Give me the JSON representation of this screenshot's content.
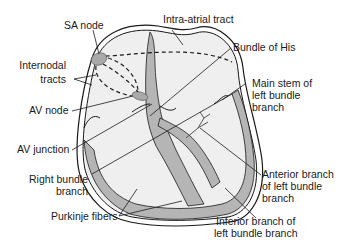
{
  "colors": {
    "background": "#ffffff",
    "chamber_fill": "#efefef",
    "tissue_fill": "#b5b5b5",
    "node_fill": "#a9a9a9",
    "outline": "#1a1a1a"
  },
  "labels": {
    "sa_node": "SA node",
    "intra_atrial_tract": "Intra-atrial tract",
    "bundle_of_his": "Bundle of His",
    "internodal_tracts_1": "Internodal",
    "internodal_tracts_2": "tracts",
    "main_stem_1": "Main stem of",
    "main_stem_2": "left bundle",
    "main_stem_3": "branch",
    "av_node": "AV node",
    "av_junction": "AV junction",
    "right_bundle_1": "Right bundle",
    "right_bundle_2": "branch",
    "anterior_1": "Anterior branch",
    "anterior_2": "of left bundle",
    "anterior_3": "branch",
    "purkinje": "Purkinje fibers",
    "inferior_1": "Inferior branch of",
    "inferior_2": "left bundle branch"
  }
}
